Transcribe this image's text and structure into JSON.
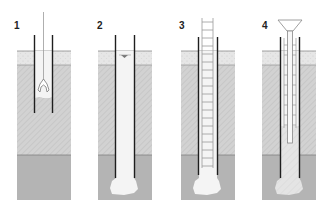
{
  "colors": {
    "background": "#ffffff",
    "topsoil": "#e6e6e6",
    "middle_layer": "#d2d2d2",
    "bottom_layer": "#b4b4b4",
    "casing": "#1e1e1e",
    "bore_void": "#f4f4f4",
    "concrete": "#e8e8e8",
    "rebar": "#9a9a9a"
  },
  "panels": [
    {
      "label": "1",
      "step": "excavation with grab inside casing"
    },
    {
      "label": "2",
      "step": "borehole with enlarged base, water level shown"
    },
    {
      "label": "3",
      "step": "reinforcement cage inserted"
    },
    {
      "label": "4",
      "step": "concreting via tremie funnel"
    }
  ]
}
